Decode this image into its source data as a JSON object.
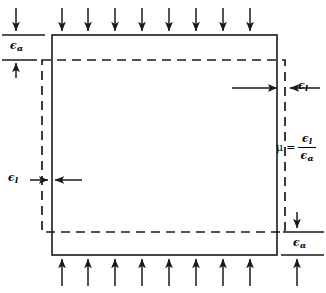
{
  "diagram": {
    "type": "engineering-mechanics-diagram",
    "colors": {
      "stroke": "#1a1a1a",
      "background": "#ffffff"
    },
    "shapes": {
      "original_body": {
        "name": "solid-rectangle",
        "style": "solid",
        "x": 52,
        "y": 35,
        "width": 225,
        "height": 220
      },
      "deformed_body": {
        "name": "dashed-rectangle",
        "style": "dashed",
        "x": 42,
        "y": 60,
        "width": 243,
        "height": 172
      }
    },
    "load_arrows": {
      "top": {
        "count": 9,
        "direction": "down"
      },
      "bottom": {
        "count": 9,
        "direction": "up"
      }
    },
    "labels": {
      "axial_symbol": "ϵ",
      "axial_subscript": "α",
      "lateral_symbol": "ϵ",
      "lateral_subscript": "l",
      "mu_symbol": "μ",
      "equals": "="
    },
    "annotations": [
      {
        "name": "axial-strain-top-left",
        "symbol": "ϵ",
        "subscript": "α",
        "x": 10,
        "y": 40
      },
      {
        "name": "lateral-strain-left",
        "symbol": "ϵ",
        "subscript": "l",
        "x": 8,
        "y": 173
      },
      {
        "name": "lateral-strain-right",
        "symbol": "ϵ",
        "subscript": "l",
        "x": 298,
        "y": 81
      },
      {
        "name": "axial-strain-bottom-right",
        "symbol": "ϵ",
        "subscript": "α",
        "x": 293,
        "y": 238
      }
    ]
  }
}
